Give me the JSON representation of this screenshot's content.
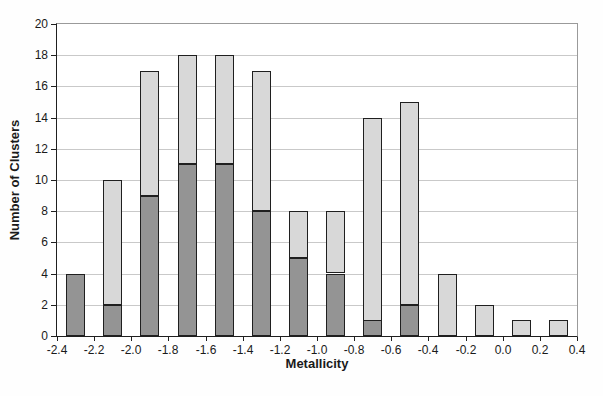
{
  "chart_data": {
    "type": "bar",
    "stacked": true,
    "title": "",
    "xlabel": "Metallicity",
    "ylabel": "Number of Clusters",
    "xlim": [
      -2.4,
      0.4
    ],
    "ylim": [
      0,
      20
    ],
    "bin_width": 0.2,
    "grid": "horizontal",
    "legend": "none",
    "x_tick_labels": [
      "-2.4",
      "-2.2",
      "-2.0",
      "-1.8",
      "-1.6",
      "-1.4",
      "-1.2",
      "-1.0",
      "-0.8",
      "-0.6",
      "-0.4",
      "-0.2",
      "0.0",
      "0.2",
      "0.4"
    ],
    "y_tick_labels": [
      "0",
      "2",
      "4",
      "6",
      "8",
      "10",
      "12",
      "14",
      "16",
      "18",
      "20"
    ],
    "categories": [
      -2.3,
      -2.1,
      -1.9,
      -1.7,
      -1.5,
      -1.3,
      -1.1,
      -0.9,
      -0.7,
      -0.5,
      -0.3,
      -0.1,
      0.1,
      0.3
    ],
    "series": [
      {
        "name": "dark-gray-segment",
        "color": "#949494",
        "values": [
          4,
          2,
          9,
          11,
          11,
          8,
          5,
          4,
          1,
          2,
          0,
          0,
          0,
          0
        ]
      },
      {
        "name": "light-gray-segment",
        "color": "#d8d8d8",
        "values": [
          0,
          8,
          8,
          7,
          7,
          9,
          3,
          4,
          13,
          13,
          4,
          2,
          1,
          1
        ]
      }
    ],
    "totals": [
      4,
      10,
      17,
      18,
      18,
      17,
      8,
      8,
      14,
      15,
      4,
      2,
      1,
      1
    ],
    "colors": {
      "bar_border": "#1f1f1f",
      "gridline": "#c9c9c9",
      "axis": "#1f1f1f",
      "plot_border": "#9a9a9a",
      "background": "#ffffff"
    }
  }
}
